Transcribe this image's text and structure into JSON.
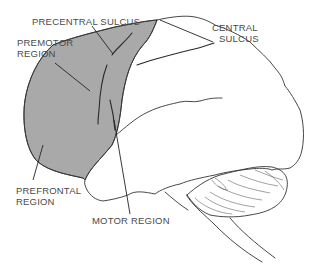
{
  "figure": {
    "shaded_color": "#a9a9a9",
    "line_color": "#333333",
    "labels": {
      "precentral_sulcus": "PRECENTRAL  SULCUS",
      "premotor_region_line1": "PREMOTOR",
      "premotor_region_line2": "REGION",
      "central_sulcus_line1": "CENTRAL",
      "central_sulcus_line2": "SULCUS",
      "prefrontal_region_line1": "PREFRONTAL",
      "prefrontal_region_line2": "REGION",
      "motor_region": "MOTOR  REGION"
    }
  }
}
